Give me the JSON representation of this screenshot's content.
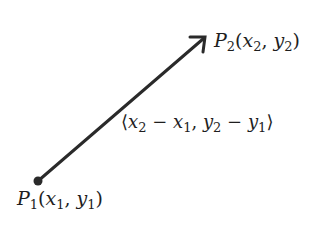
{
  "diagram": {
    "colors": {
      "stroke": "#2a2a2a",
      "text": "#1e1e1e",
      "background": "#ffffff"
    },
    "start_point": {
      "name": "P1",
      "letter": "P",
      "index": "1",
      "coords": [
        "x",
        "1",
        "y",
        "1"
      ]
    },
    "end_point": {
      "name": "P2",
      "letter": "P",
      "index": "2",
      "coords": [
        "x",
        "2",
        "y",
        "2"
      ]
    },
    "vector_label": {
      "open": "⟨",
      "close": "⟩",
      "comp1": {
        "a": "x",
        "a_sub": "2",
        "op": "−",
        "b": "x",
        "b_sub": "1"
      },
      "comp2": {
        "a": "y",
        "a_sub": "2",
        "op": "−",
        "b": "y",
        "b_sub": "1"
      }
    },
    "arrow": {
      "from": "P1",
      "to": "P2",
      "direction": "up-right"
    }
  }
}
